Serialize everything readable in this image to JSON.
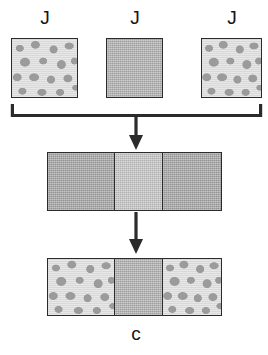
{
  "diagram": {
    "title": "",
    "type": "process-flow-schematic",
    "colors": {
      "stroke": "#2b2b2b",
      "text": "#141414",
      "blob_background": "#e2e2e2",
      "blob_spots": "#9b9b9b",
      "plain_gray": "#b2b2b2",
      "plain_gray_light": "#c2c2c2",
      "plain_gray_dark": "#ababab",
      "page_background": "#ffffff"
    },
    "top_row": {
      "items": [
        {
          "label": "J",
          "texture": "blob",
          "x": 11,
          "y": 38,
          "w": 67,
          "h": 60
        },
        {
          "label": "J",
          "texture": "plain",
          "x": 106,
          "y": 38,
          "w": 57,
          "h": 60
        },
        {
          "label": "J",
          "texture": "blob",
          "x": 201,
          "y": 38,
          "w": 61,
          "h": 60
        }
      ]
    },
    "bracket": {
      "name": "grouping-bracket",
      "left_x": 11,
      "right_x": 262,
      "y": 115,
      "tick_height": 11
    },
    "arrows": [
      {
        "name": "arrow-bracket-to-middle",
        "x": 136,
        "from_y": 115,
        "to_y": 146
      },
      {
        "name": "arrow-middle-to-bottom",
        "x": 136,
        "from_y": 212,
        "to_y": 256
      }
    ],
    "middle_block": {
      "name": "middle-stack",
      "x": 47,
      "y": 152,
      "w": 175,
      "h": 59,
      "panels": [
        {
          "texture": "plain-dark",
          "width_pct": 38
        },
        {
          "texture": "plain-light",
          "width_pct": 28
        },
        {
          "texture": "plain-dark",
          "width_pct": 34
        }
      ]
    },
    "bottom_block": {
      "name": "bottom-stack",
      "x": 47,
      "y": 258,
      "w": 175,
      "h": 58,
      "panels": [
        {
          "texture": "blob",
          "width_pct": 38
        },
        {
          "texture": "plain",
          "width_pct": 28
        },
        {
          "texture": "blob",
          "width_pct": 34
        }
      ]
    },
    "bottom_label": {
      "text": "c",
      "x": 106,
      "y": 324
    }
  }
}
